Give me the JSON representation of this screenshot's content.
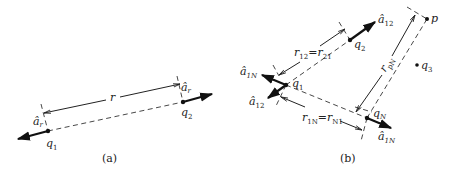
{
  "figure_a": {
    "caption": "(a)",
    "charges": [
      {
        "id": "q1",
        "label": "q",
        "sub": "1"
      },
      {
        "id": "q2",
        "label": "q",
        "sub": "2"
      }
    ],
    "unit_vectors": [
      {
        "at": "q1",
        "label": "â",
        "sub": "r"
      },
      {
        "at": "q2",
        "label": "â",
        "sub": "r"
      }
    ],
    "distance_label": "r"
  },
  "figure_b": {
    "caption": "(b)",
    "points": [
      {
        "id": "q1",
        "label": "q",
        "sub": "1"
      },
      {
        "id": "q2",
        "label": "q",
        "sub": "2"
      },
      {
        "id": "q3",
        "label": "q",
        "sub": "3"
      },
      {
        "id": "qN",
        "label": "q",
        "sub": "N"
      },
      {
        "id": "p",
        "label": "p"
      }
    ],
    "unit_vectors": [
      {
        "at": "q2",
        "label": "â",
        "sub": "12"
      },
      {
        "at": "q1_up",
        "label": "â",
        "sub": "1N"
      },
      {
        "at": "q1_down",
        "label": "â",
        "sub": "12"
      },
      {
        "at": "qN",
        "label": "â",
        "sub": "1N"
      }
    ],
    "distances": {
      "r12": {
        "a": "r",
        "a_sub": "12",
        "eq": "=",
        "b": "r",
        "b_sub": "21"
      },
      "r1N": {
        "a": "r",
        "a_sub": "1N",
        "eq": "=",
        "b": "r",
        "b_sub": "N1"
      },
      "rpN": {
        "a": "r",
        "a_sub": "pN"
      }
    }
  },
  "colors": {
    "ink": "#222222",
    "background": "#ffffff"
  }
}
